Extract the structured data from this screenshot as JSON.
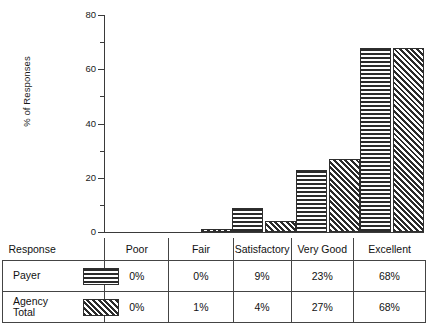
{
  "chart_data": {
    "type": "bar",
    "title": "",
    "subtitle": "",
    "xlabel": "",
    "ylabel": "% of Responses",
    "categories": [
      "Poor",
      "Fair",
      "Satisfactory",
      "Very Good",
      "Excellent"
    ],
    "series": [
      {
        "name": "Payer",
        "values": [
          0,
          0,
          9,
          23,
          68
        ],
        "pattern": "horizontal-lines"
      },
      {
        "name": "Agency Total",
        "values": [
          0,
          1,
          4,
          27,
          68
        ],
        "pattern": "diagonal-hatch"
      }
    ],
    "ylim": [
      0,
      80
    ],
    "yticks": [
      0,
      20,
      40,
      60,
      80
    ],
    "ytick_labels": [
      "0",
      "20",
      "40",
      "60",
      "80"
    ],
    "yminor_ticks": [
      10,
      30,
      50,
      70
    ],
    "grid": false,
    "legend_position": "table-below",
    "axis_color": "#3a3a3a",
    "bar_edge_color": "#2e2e2e",
    "bar_fill_color": "#2b2b2b",
    "background_color": "#ffffff"
  },
  "axis": {
    "y_label": "% of Responses",
    "tick_80": "80",
    "tick_60": "60",
    "tick_40": "40",
    "tick_20": "20",
    "tick_0": "0"
  },
  "table": {
    "header": {
      "row_label": "Response",
      "columns": [
        "Poor",
        "Fair",
        "Satisfactory",
        "Very Good",
        "Excellent"
      ]
    },
    "rows": [
      {
        "label": "Payer",
        "label_line1": "Payer",
        "label_line2": "",
        "swatch": "horizontal-lines-swatch",
        "values": [
          "0%",
          "0%",
          "9%",
          "23%",
          "68%"
        ]
      },
      {
        "label": "Agency Total",
        "label_line1": "Agency",
        "label_line2": "Total",
        "swatch": "diagonal-hatch-swatch",
        "values": [
          "0%",
          "1%",
          "4%",
          "27%",
          "68%"
        ]
      }
    ]
  }
}
